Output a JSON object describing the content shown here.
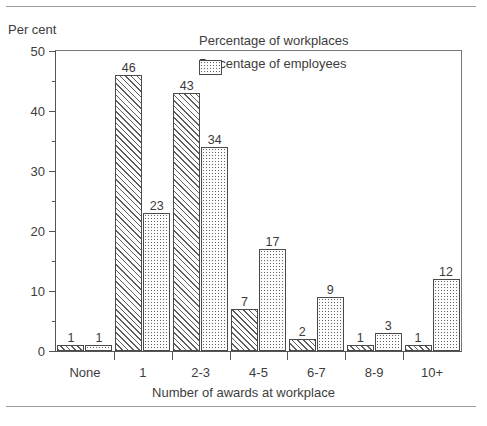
{
  "figure": {
    "ylabel": "Per cent",
    "xlabel": "Number of awards at workplace"
  },
  "legend": {
    "items": [
      {
        "label": "Percentage of workplaces",
        "pattern": "diagonal-hatch"
      },
      {
        "label": "Percentage of employees",
        "pattern": "dotted"
      }
    ]
  },
  "yticks": {
    "major": [
      "0",
      "10",
      "20",
      "30",
      "40",
      "50"
    ],
    "minor": [
      5,
      15,
      25,
      35,
      45
    ]
  },
  "chart_data": {
    "type": "bar",
    "title": "",
    "xlabel": "Number of awards at workplace",
    "ylabel": "Per cent",
    "ylim": [
      0,
      50
    ],
    "ytick_step": 10,
    "yminor_step": 5,
    "grid": false,
    "legend_position": "upper-right-inside",
    "categories": [
      "None",
      "1",
      "2-3",
      "4-5",
      "6-7",
      "8-9",
      "10+"
    ],
    "series": [
      {
        "name": "Percentage of workplaces",
        "pattern": "diagonal-hatch",
        "values": [
          1,
          46,
          43,
          7,
          2,
          1,
          1
        ]
      },
      {
        "name": "Percentage of employees",
        "pattern": "dotted",
        "values": [
          1,
          23,
          34,
          17,
          9,
          3,
          12
        ]
      }
    ]
  }
}
